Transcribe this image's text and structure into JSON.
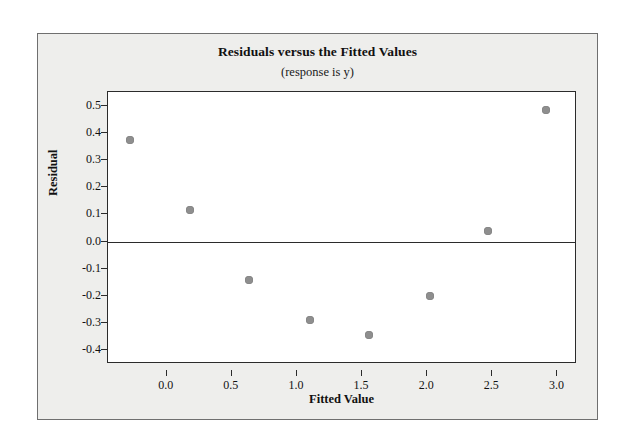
{
  "chart_data": {
    "type": "scatter",
    "title": "Residuals versus the Fitted Values",
    "subtitle": "(response is y)",
    "xlabel": "Fitted Value",
    "ylabel": "Residual",
    "xlim": [
      -0.45,
      3.15
    ],
    "ylim": [
      -0.45,
      0.55
    ],
    "xticks": [
      "0.0",
      "0.5",
      "1.0",
      "1.5",
      "2.0",
      "2.5",
      "3.0"
    ],
    "xtick_values": [
      0.0,
      0.5,
      1.0,
      1.5,
      2.0,
      2.5,
      3.0
    ],
    "yticks": [
      "0.5",
      "0.4",
      "0.3",
      "0.2",
      "0.1",
      "0.0",
      "-0.1",
      "-0.2",
      "-0.3",
      "-0.4"
    ],
    "ytick_values": [
      0.5,
      0.4,
      0.3,
      0.2,
      0.1,
      0.0,
      -0.1,
      -0.2,
      -0.3,
      -0.4
    ],
    "grid": false,
    "legend": "none",
    "reference_line": {
      "orientation": "horizontal",
      "y": 0.0
    },
    "marker_color": "#8e8e8e",
    "axis_color": "#2b2b2b",
    "background_color": "#eeeeec",
    "plot_background_color": "#ffffff",
    "x": [
      -0.28,
      0.18,
      0.63,
      1.1,
      1.55,
      2.02,
      2.47,
      2.91
    ],
    "y": [
      0.375,
      0.115,
      -0.14,
      -0.29,
      -0.345,
      -0.2,
      0.04,
      0.485
    ],
    "points": [
      {
        "x": -0.28,
        "y": 0.375
      },
      {
        "x": 0.18,
        "y": 0.115
      },
      {
        "x": 0.63,
        "y": -0.14
      },
      {
        "x": 1.1,
        "y": -0.29
      },
      {
        "x": 1.55,
        "y": -0.345
      },
      {
        "x": 2.02,
        "y": -0.2
      },
      {
        "x": 2.47,
        "y": 0.04
      },
      {
        "x": 2.91,
        "y": 0.485
      }
    ]
  }
}
